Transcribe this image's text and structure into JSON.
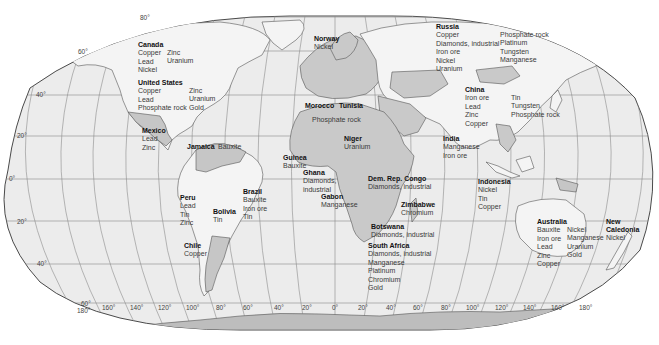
{
  "map": {
    "title": "World mineral resources",
    "colors": {
      "ocean": "#ececec",
      "land": "#f4f4f4",
      "highlight_country": "#c4c4c4",
      "antarctica": "#bdbdbd",
      "graticule": "#8a8a8a",
      "border": "#555555"
    },
    "latitude_labels": [
      {
        "text": "80°",
        "x": 140,
        "y": 17
      },
      {
        "text": "60°",
        "x": 80,
        "y": 51
      },
      {
        "text": "40°",
        "x": 36,
        "y": 93
      },
      {
        "text": "20°",
        "x": 17,
        "y": 133
      },
      {
        "text": "0°",
        "x": 9,
        "y": 177
      },
      {
        "text": "20°",
        "x": 17,
        "y": 219
      },
      {
        "text": "40°",
        "x": 37,
        "y": 262
      },
      {
        "text": "60°",
        "x": 81,
        "y": 302
      }
    ],
    "longitude_labels": [
      {
        "text": "180°",
        "x": 77,
        "y": 309
      },
      {
        "text": "160°",
        "x": 102,
        "y": 306
      },
      {
        "text": "140°",
        "x": 130,
        "y": 306
      },
      {
        "text": "120°",
        "x": 158,
        "y": 306
      },
      {
        "text": "100°",
        "x": 186,
        "y": 306
      },
      {
        "text": "80°",
        "x": 216,
        "y": 306
      },
      {
        "text": "60°",
        "x": 243,
        "y": 306
      },
      {
        "text": "40°",
        "x": 274,
        "y": 306
      },
      {
        "text": "20°",
        "x": 302,
        "y": 306
      },
      {
        "text": "0°",
        "x": 332,
        "y": 306
      },
      {
        "text": "20°",
        "x": 358,
        "y": 306
      },
      {
        "text": "40°",
        "x": 386,
        "y": 306
      },
      {
        "text": "60°",
        "x": 413,
        "y": 306
      },
      {
        "text": "80°",
        "x": 441,
        "y": 306
      },
      {
        "text": "100°",
        "x": 466,
        "y": 306
      },
      {
        "text": "120°",
        "x": 495,
        "y": 306
      },
      {
        "text": "140°",
        "x": 523,
        "y": 306
      },
      {
        "text": "160°",
        "x": 551,
        "y": 306
      },
      {
        "text": "180°",
        "x": 579,
        "y": 306
      }
    ],
    "countries": [
      {
        "name": "Canada",
        "x": 138,
        "y": 41,
        "minerals": [
          "Copper",
          "Lead",
          "Nickel"
        ]
      },
      {
        "name": "",
        "x": 167,
        "y": 49,
        "minerals": [
          "Zinc",
          "Uranium"
        ]
      },
      {
        "name": "United States",
        "x": 138,
        "y": 79,
        "minerals": [
          "Copper",
          "Lead",
          "Phosphate rock"
        ]
      },
      {
        "name": "",
        "x": 189,
        "y": 87,
        "minerals": [
          "Zinc",
          "Uranium",
          "Gold"
        ]
      },
      {
        "name": "Mexico",
        "x": 142,
        "y": 127,
        "minerals": [
          "Lead",
          "Zinc"
        ]
      },
      {
        "name": "Jamaica",
        "x": 187,
        "y": 143,
        "minerals": []
      },
      {
        "name": "",
        "x": 218,
        "y": 143,
        "minerals": [
          "Bauxite"
        ]
      },
      {
        "name": "Peru",
        "x": 180,
        "y": 194,
        "minerals": [
          "Lead",
          "Tin",
          "Zinc"
        ]
      },
      {
        "name": "Brazil",
        "x": 243,
        "y": 188,
        "minerals": [
          "Bauxite",
          "Iron ore",
          "Tin"
        ]
      },
      {
        "name": "Bolivia",
        "x": 213,
        "y": 208,
        "minerals": [
          "Tin"
        ]
      },
      {
        "name": "Chile",
        "x": 184,
        "y": 242,
        "minerals": [
          "Copper"
        ]
      },
      {
        "name": "Norway",
        "x": 314,
        "y": 35,
        "minerals": [
          "Nickel"
        ]
      },
      {
        "name": "Morocco",
        "x": 305,
        "y": 102,
        "minerals": []
      },
      {
        "name": "Tunisia",
        "x": 339,
        "y": 102,
        "minerals": []
      },
      {
        "name": "",
        "x": 312,
        "y": 116,
        "minerals": [
          "Phosphate rock"
        ]
      },
      {
        "name": "Niger",
        "x": 344,
        "y": 135,
        "minerals": [
          "Uranium"
        ]
      },
      {
        "name": "Guinea",
        "x": 283,
        "y": 154,
        "minerals": [
          "Bauxite"
        ]
      },
      {
        "name": "Ghana",
        "x": 303,
        "y": 169,
        "minerals": [
          "Diamonds,",
          "industrial"
        ]
      },
      {
        "name": "Gabon",
        "x": 321,
        "y": 193,
        "minerals": [
          "Manganese"
        ]
      },
      {
        "name": "Dem. Rep. Congo",
        "x": 368,
        "y": 175,
        "minerals": [
          "Diamonds, industrial"
        ]
      },
      {
        "name": "Zimbabwe",
        "x": 401,
        "y": 201,
        "minerals": [
          "Chromium"
        ]
      },
      {
        "name": "Botswana",
        "x": 371,
        "y": 223,
        "minerals": [
          "Diamonds, industrial"
        ]
      },
      {
        "name": "South Africa",
        "x": 368,
        "y": 242,
        "minerals": [
          "Diamonds, industrial",
          "Manganese",
          "Platinum",
          "Chromium",
          "Gold"
        ]
      },
      {
        "name": "Russia",
        "x": 436,
        "y": 23,
        "minerals": [
          "Copper",
          "Diamonds, industrial",
          "Iron ore",
          "Nickel",
          "Uranium"
        ]
      },
      {
        "name": "",
        "x": 500,
        "y": 31,
        "minerals": [
          "Phosphate rock",
          "Platinum",
          "Tungsten",
          "Manganese"
        ]
      },
      {
        "name": "China",
        "x": 465,
        "y": 86,
        "minerals": [
          "Iron ore",
          "Lead",
          "Zinc",
          "Copper"
        ]
      },
      {
        "name": "",
        "x": 511,
        "y": 94,
        "minerals": [
          "Tin",
          "Tungsten",
          "Phosphate rock"
        ]
      },
      {
        "name": "India",
        "x": 443,
        "y": 135,
        "minerals": [
          "Manganese",
          "Iron ore"
        ]
      },
      {
        "name": "Indonesia",
        "x": 478,
        "y": 178,
        "minerals": [
          "Nickel",
          "Tin",
          "Copper"
        ]
      },
      {
        "name": "Australia",
        "x": 537,
        "y": 218,
        "minerals": [
          "Bauxite",
          "Iron ore",
          "Lead",
          "Zinc",
          "Copper"
        ]
      },
      {
        "name": "",
        "x": 567,
        "y": 226,
        "minerals": [
          "Nickel",
          "Manganese",
          "Uranium",
          "Gold"
        ]
      },
      {
        "name": "New",
        "x": 606,
        "y": 218,
        "minerals": []
      },
      {
        "name": "Caledonia",
        "x": 606,
        "y": 226,
        "minerals": [
          "Nickel"
        ]
      }
    ]
  }
}
